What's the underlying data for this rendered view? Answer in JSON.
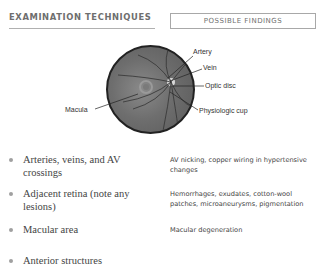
{
  "header": {
    "left_title": "EXAMINATION TECHNIQUES",
    "right_title": "POSSIBLE FINDINGS"
  },
  "figure": {
    "labels": {
      "artery": "Artery",
      "vein": "Vein",
      "optic_disc": "Optic disc",
      "macula": "Macula",
      "physiologic_cup": "Physiologic cup"
    }
  },
  "rows": [
    {
      "technique": "Arteries, veins, and AV crossings",
      "finding": "AV nicking, copper wiring in hypertensive changes"
    },
    {
      "technique": "Adjacent retina (note any lesions)",
      "finding": "Hemorrhages, exudates, cotton-wool patches, microaneurysms, pigmentation"
    },
    {
      "technique": "Macular area",
      "finding": "Macular degeneration"
    },
    {
      "technique": "Anterior structures",
      "finding": ""
    }
  ],
  "colors": {
    "header_text": "#6e6e6e",
    "body_text": "#444444",
    "fundus_border": "#222222"
  }
}
